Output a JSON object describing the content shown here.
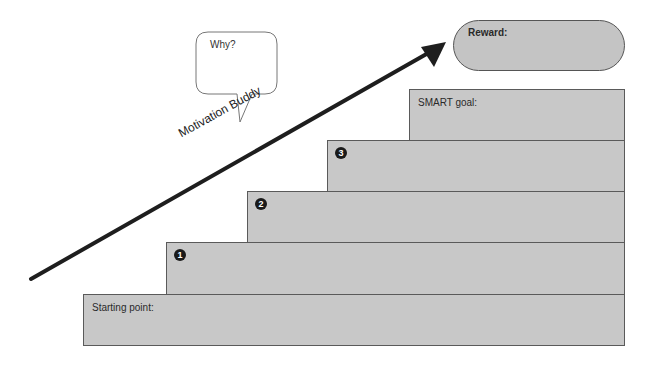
{
  "diagram": {
    "title_arrow_label": "Motivation Buddy",
    "speech_bubble": {
      "text": "Why?"
    },
    "reward": {
      "label": "Reward:"
    },
    "steps": [
      {
        "label": "Starting point:",
        "number": ""
      },
      {
        "label": "",
        "number": "1"
      },
      {
        "label": "",
        "number": "2"
      },
      {
        "label": "",
        "number": "3"
      },
      {
        "label": "SMART goal:",
        "number": ""
      }
    ],
    "colors": {
      "step_fill": "#c8c8c8",
      "step_border": "#5a5a5a",
      "arrow": "#1e1e1e",
      "number_badge": "#1a1a1a"
    }
  }
}
